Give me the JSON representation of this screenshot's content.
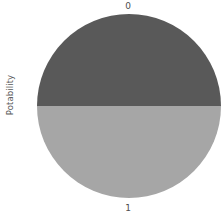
{
  "chart_data": {
    "type": "pie",
    "title": "",
    "ylabel": "Potability",
    "xlabel": "",
    "categories": [
      "0",
      "1"
    ],
    "values": [
      50,
      50
    ],
    "labels": [
      "0",
      "1"
    ],
    "label_positions": [
      "top",
      "bottom"
    ],
    "colors": [
      "#595959",
      "#a6a6a6"
    ],
    "legend": "none",
    "grid": false,
    "background": "#ffffff"
  },
  "axis": {
    "ylabel": "Potability"
  },
  "slices": [
    {
      "label": "0",
      "value": 50,
      "color": "#595959"
    },
    {
      "label": "1",
      "value": 50,
      "color": "#a6a6a6"
    }
  ]
}
